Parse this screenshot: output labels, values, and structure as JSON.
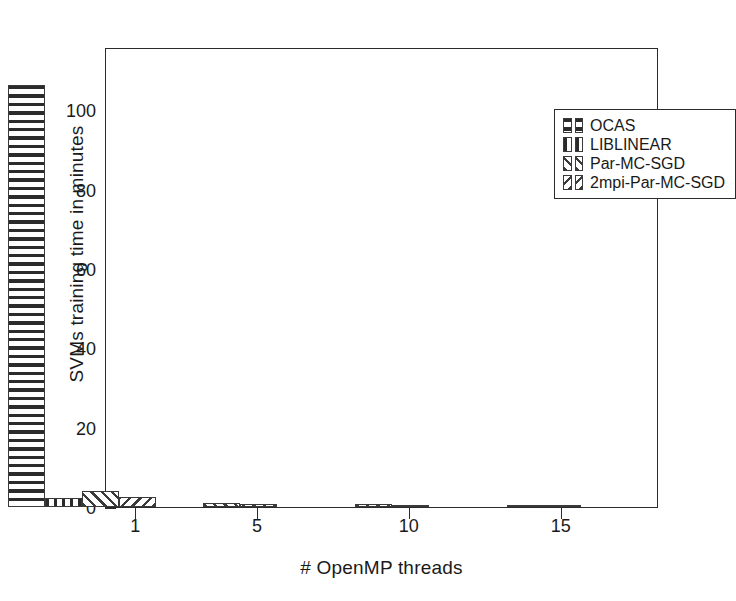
{
  "chart_data": {
    "type": "bar",
    "title": "",
    "xlabel": "# OpenMP threads",
    "ylabel": "SVMs training time in minutes",
    "xlim": [
      0,
      18.2
    ],
    "ylim": [
      0,
      116
    ],
    "grid": false,
    "legend_position": "upper right",
    "xticks": [
      1,
      5,
      10,
      15
    ],
    "xtick_labels": [
      "1",
      "5",
      "10",
      "15"
    ],
    "yticks": [
      0,
      20,
      40,
      60,
      80,
      100
    ],
    "ytick_labels": [
      "0",
      "20",
      "40",
      "60",
      "80",
      "100"
    ],
    "categories": [
      1,
      5,
      10,
      15
    ],
    "series": [
      {
        "name": "OCAS",
        "hatch": "horizontal",
        "values": [
          106.5,
          0,
          0,
          0
        ]
      },
      {
        "name": "LIBLINEAR",
        "hatch": "vertical",
        "values": [
          2.2,
          0,
          0,
          0
        ]
      },
      {
        "name": "Par-MC-SGD",
        "hatch": "diagonal-forward",
        "values": [
          4.1,
          1.0,
          0.7,
          0.6
        ]
      },
      {
        "name": "2mpi-Par-MC-SGD",
        "hatch": "diagonal-back",
        "values": [
          2.4,
          0.8,
          0.6,
          0.5
        ]
      }
    ]
  },
  "axes": {
    "ylabel": "SVMs training time in minutes",
    "xlabel": "# OpenMP threads",
    "ytick_labels": [
      "0",
      "20",
      "40",
      "60",
      "80",
      "100"
    ],
    "xtick_labels": [
      "1",
      "5",
      "10",
      "15"
    ]
  },
  "legend": {
    "entries": [
      {
        "label": "OCAS",
        "hatch": "horizontal"
      },
      {
        "label": "LIBLINEAR",
        "hatch": "vertical"
      },
      {
        "label": "Par-MC-SGD",
        "hatch": "diagonal-forward"
      },
      {
        "label": "2mpi-Par-MC-SGD",
        "hatch": "diagonal-back"
      }
    ]
  },
  "colors": {
    "axis": "#2b2b2b",
    "bar_edge": "#3a3a3a",
    "hatch": "#2b2b2b",
    "background": "#ffffff"
  }
}
